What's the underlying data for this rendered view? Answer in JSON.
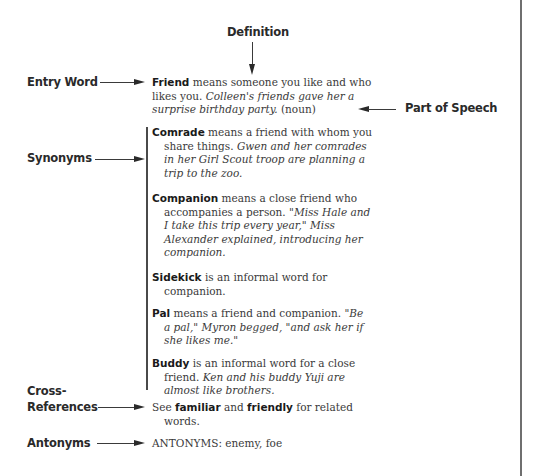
{
  "labels": {
    "definition": "Definition",
    "entry_word": "Entry Word",
    "part_of_speech": "Part of Speech",
    "synonyms": "Synonyms",
    "cross_references_line1": "Cross-",
    "cross_references_line2": "References",
    "antonyms": "Antonyms"
  },
  "main_entry": {
    "word": "Friend",
    "definition": " means someone you like and who likes you. ",
    "example": "Colleen's friends gave her a surprise birthday party.",
    "pos": " (noun)"
  },
  "synonyms": [
    {
      "word": "Comrade",
      "definition": " means a friend with whom you share things. ",
      "example": "Gwen and her comrades in her Girl Scout troop are planning a trip to the zoo."
    },
    {
      "word": "Companion",
      "definition": " means a close friend who accompanies a person. ",
      "example": "\"Miss Hale and I take this trip every year,\" Miss Alexander explained, introducing her companion."
    },
    {
      "word": "Sidekick",
      "definition": " is an informal word for companion.",
      "example": ""
    },
    {
      "word": "Pal",
      "definition": " means a friend and companion. ",
      "example": "\"Be a pal,\" Myron begged, \"and ask her if she likes me.\""
    },
    {
      "word": "Buddy",
      "definition": " is an informal word for a close friend. ",
      "example": "Ken and his buddy Yuji are almost like brothers."
    }
  ],
  "cross_reference": {
    "prefix": "See ",
    "word1": "familiar",
    "middle": " and ",
    "word2": "friendly",
    "suffix": " for related words."
  },
  "antonyms": {
    "text": "ANTONYMS: enemy, foe"
  },
  "colors": {
    "text": "#2a2a2a",
    "lines": "#3a3a3a",
    "frame": "#6f6f6f"
  }
}
